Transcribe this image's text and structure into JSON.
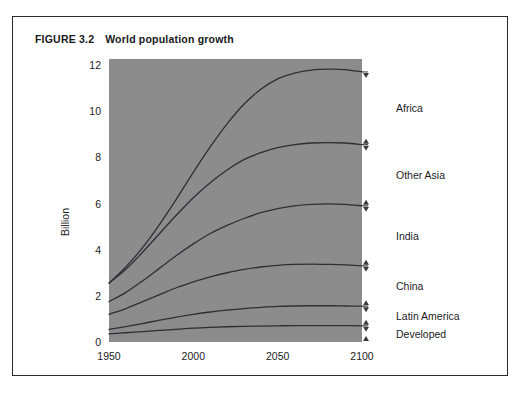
{
  "figure": {
    "number": "FIGURE 3.2",
    "title": "World population growth"
  },
  "chart_data": {
    "type": "area",
    "title": "World population growth",
    "xlabel": "",
    "ylabel": "Billion",
    "xlim": [
      1950,
      2100
    ],
    "ylim": [
      0,
      12
    ],
    "xticks": [
      "1950",
      "2000",
      "2050",
      "2100"
    ],
    "xtick_values": [
      1950,
      2000,
      2050,
      2100
    ],
    "yticks": [
      "0",
      "2",
      "4",
      "6",
      "8",
      "10",
      "12"
    ],
    "ytick_values": [
      0,
      2,
      4,
      6,
      8,
      10,
      12
    ],
    "grid": false,
    "legend_position": "right-of-plot-inline-labels",
    "stacked": true,
    "note": "Curves are cumulative totals; each labelled band is the gap between adjacent curves.",
    "x": [
      1950,
      1960,
      1970,
      1980,
      1990,
      2000,
      2010,
      2020,
      2030,
      2040,
      2050,
      2060,
      2070,
      2080,
      2090,
      2100
    ],
    "series": [
      {
        "name": "Developed",
        "cumulative": [
          0.35,
          0.4,
          0.45,
          0.5,
          0.55,
          0.6,
          0.63,
          0.66,
          0.68,
          0.69,
          0.7,
          0.71,
          0.71,
          0.71,
          0.71,
          0.7
        ],
        "band_values": [
          0.35,
          0.4,
          0.45,
          0.5,
          0.55,
          0.6,
          0.63,
          0.66,
          0.68,
          0.69,
          0.7,
          0.71,
          0.71,
          0.71,
          0.71,
          0.7
        ]
      },
      {
        "name": "Latin America",
        "cumulative": [
          0.55,
          0.67,
          0.8,
          0.95,
          1.08,
          1.2,
          1.3,
          1.38,
          1.45,
          1.5,
          1.54,
          1.56,
          1.57,
          1.57,
          1.56,
          1.55
        ],
        "band_values": [
          0.2,
          0.27,
          0.35,
          0.45,
          0.53,
          0.6,
          0.67,
          0.72,
          0.77,
          0.81,
          0.84,
          0.85,
          0.86,
          0.86,
          0.85,
          0.85
        ]
      },
      {
        "name": "China",
        "cumulative": [
          1.2,
          1.45,
          1.75,
          2.05,
          2.35,
          2.6,
          2.82,
          3.0,
          3.15,
          3.25,
          3.32,
          3.36,
          3.37,
          3.36,
          3.34,
          3.3
        ],
        "band_values": [
          0.65,
          0.78,
          0.95,
          1.1,
          1.27,
          1.4,
          1.52,
          1.62,
          1.7,
          1.75,
          1.78,
          1.8,
          1.8,
          1.79,
          1.78,
          1.75
        ]
      },
      {
        "name": "India",
        "cumulative": [
          1.75,
          2.15,
          2.65,
          3.2,
          3.75,
          4.25,
          4.7,
          5.05,
          5.35,
          5.6,
          5.78,
          5.9,
          5.96,
          5.98,
          5.96,
          5.9
        ],
        "band_values": [
          0.55,
          0.7,
          0.9,
          1.15,
          1.4,
          1.65,
          1.88,
          2.05,
          2.2,
          2.35,
          2.46,
          2.54,
          2.59,
          2.62,
          2.62,
          2.6
        ]
      },
      {
        "name": "Other Asia",
        "cumulative": [
          2.55,
          3.15,
          3.9,
          4.7,
          5.5,
          6.25,
          6.9,
          7.45,
          7.9,
          8.2,
          8.42,
          8.55,
          8.62,
          8.64,
          8.62,
          8.55
        ],
        "band_values": [
          0.8,
          1.0,
          1.25,
          1.5,
          1.75,
          2.0,
          2.2,
          2.4,
          2.55,
          2.6,
          2.64,
          2.65,
          2.66,
          2.66,
          2.66,
          2.65
        ]
      },
      {
        "name": "Africa",
        "cumulative": [
          2.55,
          3.25,
          4.1,
          5.1,
          6.2,
          7.35,
          8.45,
          9.45,
          10.3,
          10.95,
          11.4,
          11.65,
          11.78,
          11.82,
          11.8,
          11.7
        ],
        "band_values": [
          0.0,
          0.1,
          0.2,
          0.4,
          0.7,
          1.1,
          1.55,
          2.0,
          2.4,
          2.75,
          2.98,
          3.1,
          3.16,
          3.18,
          3.18,
          3.15
        ]
      }
    ],
    "band_labels": [
      {
        "name": "Africa",
        "y_top": 11.7,
        "y_bottom": 8.55
      },
      {
        "name": "Other Asia",
        "y_top": 8.55,
        "y_bottom": 5.9
      },
      {
        "name": "India",
        "y_top": 5.9,
        "y_bottom": 3.3
      },
      {
        "name": "China",
        "y_top": 3.3,
        "y_bottom": 1.55
      },
      {
        "name": "Latin America",
        "y_top": 1.55,
        "y_bottom": 0.7
      },
      {
        "name": "Developed",
        "y_top": 0.7,
        "y_bottom": 0.0
      }
    ]
  },
  "colors": {
    "plot_background": "#8c8c8c",
    "line": "#2f2f33",
    "text": "#1b1b1e",
    "border": "#2b2b2b",
    "page_background": "#ffffff"
  }
}
